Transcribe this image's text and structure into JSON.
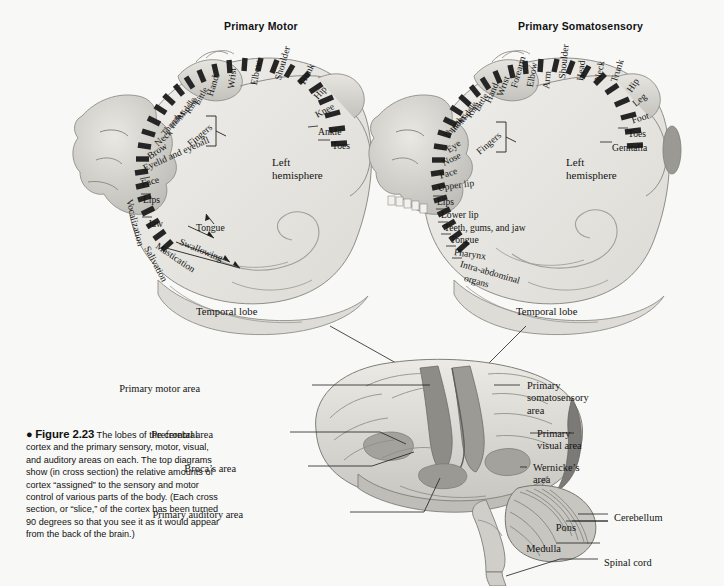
{
  "figure": {
    "bullet": "●",
    "number": "Figure 2.23",
    "caption": " The lobes of the cerebral cortex and the primary sensory, motor, visual, and auditory areas on each. The top diagrams show (in cross section) the relative amounts of cortex “assigned” to the sensory and motor control of various parts of the body. (Each cross section, or “slice,” of the cortex has been turned 90 degrees so that you see it as it would appear from the back of the brain.)"
  },
  "panels": {
    "motor": {
      "title": "Primary Motor",
      "hemisphere": "Left\nhemisphere",
      "temporal_lobe": "Temporal lobe",
      "fingers_bracket": "Fingers",
      "labels": [
        {
          "text": "Toes",
          "x": 332,
          "y": 140,
          "rot": 0,
          "cls": "lbl"
        },
        {
          "text": "Ankle",
          "x": 318,
          "y": 126,
          "rot": 0,
          "cls": "lbl"
        },
        {
          "text": "Knee",
          "x": 313,
          "y": 110,
          "rot": -28,
          "cls": "lbl"
        },
        {
          "text": "Hip",
          "x": 311,
          "y": 94,
          "rot": -48,
          "cls": "lbl"
        },
        {
          "text": "Trunk",
          "x": 296,
          "y": 82,
          "rot": -62,
          "cls": "lbl"
        },
        {
          "text": "Shoulder",
          "x": 272,
          "y": 78,
          "rot": -74,
          "cls": "lbl"
        },
        {
          "text": "Elbow",
          "x": 248,
          "y": 84,
          "rot": -80,
          "cls": "lbl"
        },
        {
          "text": "Wrist",
          "x": 225,
          "y": 88,
          "rot": -84,
          "cls": "lbl"
        },
        {
          "text": "Hand",
          "x": 204,
          "y": 94,
          "rot": -73,
          "cls": "lbl"
        },
        {
          "text": "Little",
          "x": 192,
          "y": 102,
          "rot": -62,
          "cls": "lbl sm"
        },
        {
          "text": "Ring",
          "x": 183,
          "y": 110,
          "rot": -58,
          "cls": "lbl sm"
        },
        {
          "text": "Middle",
          "x": 175,
          "y": 116,
          "rot": -55,
          "cls": "lbl sm"
        },
        {
          "text": "Index",
          "x": 167,
          "y": 124,
          "rot": -52,
          "cls": "lbl sm"
        },
        {
          "text": "Thumb",
          "x": 159,
          "y": 131,
          "rot": -50,
          "cls": "lbl sm"
        },
        {
          "text": "Neck",
          "x": 152,
          "y": 140,
          "rot": -42,
          "cls": "lbl"
        },
        {
          "text": "Brow",
          "x": 145,
          "y": 152,
          "rot": -34,
          "cls": "lbl"
        },
        {
          "text": "Eyelid and eyeball",
          "x": 141,
          "y": 163,
          "rot": -24,
          "cls": "lbl"
        },
        {
          "text": "Face",
          "x": 140,
          "y": 178,
          "rot": -14,
          "cls": "lbl"
        },
        {
          "text": "Lips",
          "x": 143,
          "y": 194,
          "rot": 0,
          "cls": "lbl"
        },
        {
          "text": "Vocalization",
          "x": 135,
          "y": 198,
          "rot": 76,
          "cls": "lbl"
        },
        {
          "text": "Jaw",
          "x": 148,
          "y": 218,
          "rot": 0,
          "cls": "lbl"
        },
        {
          "text": "Tongue",
          "x": 196,
          "y": 222,
          "rot": 0,
          "cls": "lbl"
        },
        {
          "text": "Swallowing",
          "x": 182,
          "y": 236,
          "rot": 22,
          "cls": "lbl"
        },
        {
          "text": "Mastication",
          "x": 160,
          "y": 240,
          "rot": 34,
          "cls": "lbl"
        },
        {
          "text": "Salivation",
          "x": 152,
          "y": 244,
          "rot": 62,
          "cls": "lbl"
        }
      ]
    },
    "somatosensory": {
      "title": "Primary Somatosensory",
      "hemisphere": "Left\nhemisphere",
      "temporal_lobe": "Temporal lobe",
      "fingers_bracket": "Fingers",
      "labels": [
        {
          "text": "Genitalia",
          "x": 612,
          "y": 142,
          "rot": 0,
          "cls": "lbl"
        },
        {
          "text": "Toes",
          "x": 628,
          "y": 128,
          "rot": 0,
          "cls": "lbl"
        },
        {
          "text": "Foot",
          "x": 630,
          "y": 115,
          "rot": -18,
          "cls": "lbl"
        },
        {
          "text": "Leg",
          "x": 630,
          "y": 100,
          "rot": -40,
          "cls": "lbl"
        },
        {
          "text": "Hip",
          "x": 624,
          "y": 88,
          "rot": -56,
          "cls": "lbl"
        },
        {
          "text": "Trunk",
          "x": 608,
          "y": 80,
          "rot": -72,
          "cls": "lbl"
        },
        {
          "text": "Neck",
          "x": 592,
          "y": 80,
          "rot": -80,
          "cls": "lbl"
        },
        {
          "text": "Head",
          "x": 574,
          "y": 80,
          "rot": -84,
          "cls": "lbl"
        },
        {
          "text": "Shoulder",
          "x": 556,
          "y": 78,
          "rot": -84,
          "cls": "lbl"
        },
        {
          "text": "Arm",
          "x": 540,
          "y": 88,
          "rot": -84,
          "cls": "lbl"
        },
        {
          "text": "Elbow",
          "x": 524,
          "y": 86,
          "rot": -80,
          "cls": "lbl"
        },
        {
          "text": "Forearm",
          "x": 508,
          "y": 86,
          "rot": -74,
          "cls": "lbl"
        },
        {
          "text": "Wrist",
          "x": 494,
          "y": 94,
          "rot": -70,
          "cls": "lbl"
        },
        {
          "text": "Hand",
          "x": 482,
          "y": 100,
          "rot": -66,
          "cls": "lbl"
        },
        {
          "text": "Little",
          "x": 472,
          "y": 108,
          "rot": -60,
          "cls": "lbl sm"
        },
        {
          "text": "Ring",
          "x": 464,
          "y": 114,
          "rot": -56,
          "cls": "lbl sm"
        },
        {
          "text": "Middle",
          "x": 456,
          "y": 120,
          "rot": -54,
          "cls": "lbl sm"
        },
        {
          "text": "Index",
          "x": 448,
          "y": 128,
          "rot": -52,
          "cls": "lbl sm"
        },
        {
          "text": "Thumb",
          "x": 441,
          "y": 134,
          "rot": -50,
          "cls": "lbl sm"
        },
        {
          "text": "Eye",
          "x": 444,
          "y": 146,
          "rot": -36,
          "cls": "lbl"
        },
        {
          "text": "Nose",
          "x": 440,
          "y": 158,
          "rot": -26,
          "cls": "lbl"
        },
        {
          "text": "Face",
          "x": 438,
          "y": 170,
          "rot": -16,
          "cls": "lbl"
        },
        {
          "text": "Upper lip",
          "x": 437,
          "y": 182,
          "rot": -8,
          "cls": "lbl"
        },
        {
          "text": "Lips",
          "x": 437,
          "y": 196,
          "rot": 0,
          "cls": "lbl"
        },
        {
          "text": "Lower lip",
          "x": 441,
          "y": 209,
          "rot": 0,
          "cls": "lbl"
        },
        {
          "text": "Teeth, gums, and jaw",
          "x": 444,
          "y": 222,
          "rot": 0,
          "cls": "lbl"
        },
        {
          "text": "Tongue",
          "x": 450,
          "y": 234,
          "rot": 0,
          "cls": "lbl"
        },
        {
          "text": "Pharynx",
          "x": 455,
          "y": 246,
          "rot": 8,
          "cls": "lbl"
        },
        {
          "text": "Intra-abdominal",
          "x": 462,
          "y": 258,
          "rot": 16,
          "cls": "lbl"
        },
        {
          "text": "organs",
          "x": 466,
          "y": 272,
          "rot": 16,
          "cls": "lbl"
        }
      ]
    }
  },
  "brain": {
    "labels_left": [
      {
        "text": "Primary motor area",
        "x": 200,
        "y": 383
      },
      {
        "text": "Prefrontal area",
        "x": 213,
        "y": 429
      },
      {
        "text": "Broca’s area",
        "x": 236,
        "y": 463
      },
      {
        "text": "Primary auditory area",
        "x": 243,
        "y": 509
      },
      {
        "text": "Pons",
        "x": 576,
        "y": 522
      },
      {
        "text": "Medulla",
        "x": 561,
        "y": 543
      }
    ],
    "labels_right": [
      {
        "text": "Primary\nsomatosensory\narea",
        "x": 527,
        "y": 380
      },
      {
        "text": "Primary\nvisual area",
        "x": 537,
        "y": 428
      },
      {
        "text": "Wernicke’s\narea",
        "x": 533,
        "y": 462
      },
      {
        "text": "Cerebellum",
        "x": 614,
        "y": 512
      },
      {
        "text": "Spinal cord",
        "x": 604,
        "y": 557
      }
    ]
  },
  "colors": {
    "background": "#f8f8f6",
    "ink": "#141414",
    "cortex_fill": "#e8e7e3",
    "cortex_dark": "#8f8e8a",
    "tissue_light": "#d9d8d3",
    "tissue_mid": "#bdbcb7",
    "strip_dark": "#2b2b2b"
  }
}
